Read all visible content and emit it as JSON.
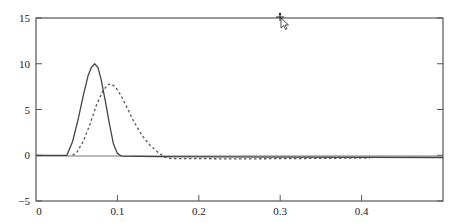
{
  "chart_data": {
    "type": "line",
    "title": "",
    "xlabel": "",
    "ylabel": "",
    "xlim": [
      0,
      0.5
    ],
    "ylim": [
      -5,
      15
    ],
    "grid": false,
    "legend": null,
    "x_ticks": [
      0,
      0.1,
      0.2,
      0.3,
      0.4
    ],
    "x_tick_labels": [
      "0",
      "0.1",
      "0.2",
      "0.3",
      "0.4"
    ],
    "y_ticks": [
      -5,
      0,
      5,
      10,
      15
    ],
    "y_tick_labels": [
      "−5",
      "0",
      "5",
      "10",
      "15"
    ],
    "series": [
      {
        "name": "solid",
        "style": "solid",
        "color": "#444444",
        "x": [
          0,
          0.038,
          0.045,
          0.052,
          0.058,
          0.064,
          0.068,
          0.072,
          0.076,
          0.08,
          0.085,
          0.09,
          0.095,
          0.1,
          0.105,
          0.15,
          0.3,
          0.5
        ],
        "y": [
          0,
          0,
          1.5,
          4.0,
          6.5,
          8.7,
          9.6,
          10.0,
          9.6,
          8.3,
          6.0,
          3.5,
          1.3,
          0.2,
          -0.1,
          -0.15,
          -0.2,
          -0.25
        ]
      },
      {
        "name": "dashed",
        "style": "dashed",
        "color": "#555555",
        "x": [
          0.045,
          0.05,
          0.058,
          0.066,
          0.074,
          0.082,
          0.088,
          0.092,
          0.097,
          0.104,
          0.112,
          0.12,
          0.13,
          0.14,
          0.15,
          0.158,
          0.166,
          0.25,
          0.33,
          0.41
        ],
        "y": [
          0,
          0.3,
          1.5,
          3.3,
          5.4,
          7.0,
          7.7,
          7.8,
          7.5,
          6.6,
          5.2,
          3.7,
          2.2,
          1.1,
          0.3,
          -0.2,
          -0.35,
          -0.4,
          -0.35,
          -0.3
        ]
      }
    ]
  }
}
